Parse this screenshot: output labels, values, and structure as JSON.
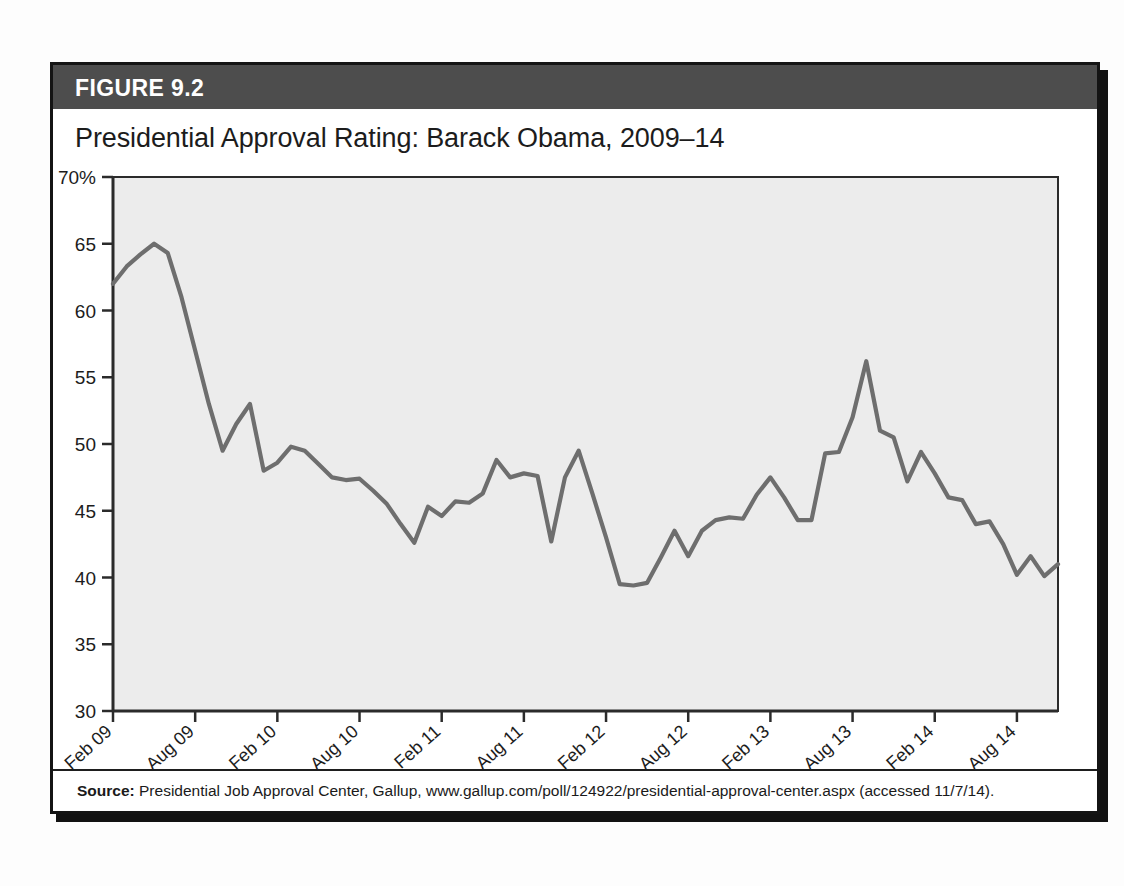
{
  "figure": {
    "header_label": "FIGURE 9.2",
    "title": "Presidential Approval Rating: Barack Obama, 2009–14",
    "source_label": "Source:",
    "source_text": " Presidential Job Approval Center, Gallup, www.gallup.com/poll/124922/presidential-approval-center.aspx (accessed 11/7/14)."
  },
  "colors": {
    "header_bar": "#4d4d4d",
    "plot_background": "#ececec",
    "line": "#6e6e6e",
    "axis": "#2b2b2b",
    "text": "#1c1c1c",
    "box_border": "#141414"
  },
  "chart_data": {
    "type": "line",
    "title": "Presidential Approval Rating: Barack Obama, 2009–14",
    "xlabel": "",
    "ylabel": "",
    "ylim": [
      30,
      70
    ],
    "yticks": [
      30,
      35,
      40,
      45,
      50,
      55,
      60,
      65,
      70
    ],
    "ytick_labels": [
      "30",
      "35",
      "40",
      "45",
      "50",
      "55",
      "60",
      "65",
      "70%"
    ],
    "grid": false,
    "legend": false,
    "xtick_labels": [
      "Feb 09",
      "Aug 09",
      "Feb 10",
      "Aug 10",
      "Feb 11",
      "Aug 11",
      "Feb 12",
      "Aug 12",
      "Feb 13",
      "Aug 13",
      "Feb 14",
      "Aug 14"
    ],
    "xtick_positions_months": [
      0,
      6,
      12,
      18,
      24,
      30,
      36,
      42,
      48,
      54,
      60,
      66
    ],
    "x_range_months": [
      0,
      69
    ],
    "series": [
      {
        "name": "Approval",
        "x_months": [
          0,
          1,
          2,
          3,
          4,
          5,
          6,
          7,
          8,
          9,
          10,
          11,
          12,
          13,
          14,
          15,
          16,
          17,
          18,
          19,
          20,
          21,
          22,
          23,
          24,
          25,
          26,
          27,
          28,
          29,
          30,
          31,
          32,
          33,
          34,
          35,
          36,
          37,
          38,
          39,
          40,
          41,
          42,
          43,
          44,
          45,
          46,
          47,
          48,
          49,
          50,
          51,
          52,
          53,
          54,
          55,
          56,
          57,
          58,
          59,
          60,
          61,
          62,
          63,
          64,
          65,
          66,
          67,
          68,
          69
        ],
        "values": [
          62.0,
          63.3,
          64.2,
          65.0,
          64.3,
          61.0,
          57.0,
          53.0,
          49.5,
          51.5,
          53.0,
          48.0,
          48.6,
          49.8,
          49.5,
          48.5,
          47.5,
          47.3,
          47.4,
          46.5,
          45.5,
          44.0,
          42.6,
          45.3,
          44.6,
          45.7,
          45.6,
          46.3,
          48.8,
          47.5,
          47.8,
          47.6,
          42.7,
          47.5,
          49.5,
          46.3,
          43.0,
          39.5,
          39.4,
          39.6,
          41.5,
          43.5,
          41.6,
          43.5,
          44.3,
          44.5,
          44.4,
          46.2,
          47.5,
          46.0,
          44.3,
          44.3,
          49.3,
          49.4,
          52.0,
          56.2,
          51.0,
          50.5,
          47.2,
          49.4,
          47.8,
          46.0,
          45.8,
          44.0,
          44.2,
          42.5,
          40.2,
          41.6,
          40.1,
          41.0,
          43.2,
          43.1,
          41.0,
          41.0,
          41.0
        ]
      }
    ]
  }
}
